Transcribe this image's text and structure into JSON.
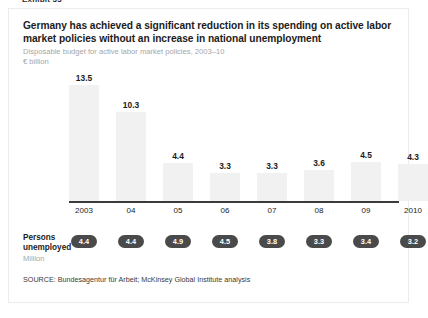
{
  "exhibit_header": "Exhibit 33",
  "card": {
    "title": "Germany has achieved a significant reduction in its spending on active labor market policies without an increase in national unemployment",
    "subtitle": "Disposable budget for active labor market policies, 2003–10",
    "units": "€ billion",
    "persons_label_line1": "Persons",
    "persons_label_line2": "unemployed",
    "persons_units": "Million",
    "source": "SOURCE: Bundesagentur für Arbeit; McKinsey Global Institute analysis"
  },
  "colors": {
    "bar_fill": "#f1f1f1",
    "axis": "#3b3b3b",
    "pill_fill": "#4a4a4a",
    "pill_text": "#ffffff",
    "subtitle_gray": "#a6a6a6",
    "text": "#1c1c1c"
  },
  "chart_data": {
    "type": "bar",
    "title": "Germany has achieved a significant reduction in its spending on active labor market policies without an increase in national unemployment",
    "subtitle": "Disposable budget for active labor market policies, 2003–10",
    "xlabel": "",
    "ylabel": "€ billion",
    "ylim": [
      0,
      13.5
    ],
    "grid": false,
    "legend": "none",
    "categories": [
      "2003",
      "04",
      "05",
      "06",
      "07",
      "08",
      "09",
      "2010"
    ],
    "values": [
      13.5,
      10.3,
      4.4,
      3.3,
      3.3,
      3.6,
      4.5,
      4.3
    ],
    "value_labels": [
      "13.5",
      "10.3",
      "4.4",
      "3.3",
      "3.3",
      "3.6",
      "4.5",
      "4.3"
    ],
    "secondary_series": {
      "name": "Persons unemployed",
      "units": "Million",
      "values": [
        4.4,
        4.4,
        4.9,
        4.5,
        3.8,
        3.3,
        3.4,
        3.2
      ],
      "value_labels": [
        "4.4",
        "4.4",
        "4.9",
        "4.5",
        "3.8",
        "3.3",
        "3.4",
        "3.2"
      ]
    }
  }
}
